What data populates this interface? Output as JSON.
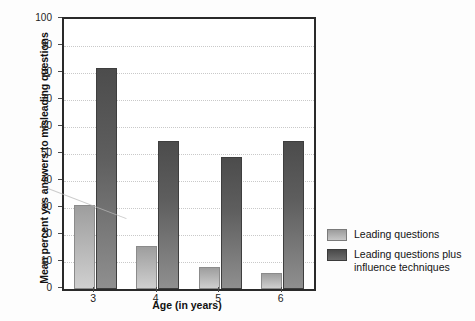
{
  "chart_data": {
    "type": "bar",
    "title": "",
    "xlabel": "Age (in years)",
    "ylabel": "Mean percent yes answers to misleading questions",
    "categories": [
      "3",
      "4",
      "5",
      "6"
    ],
    "ylim": [
      0,
      100
    ],
    "yticks": [
      0,
      10,
      20,
      30,
      40,
      50,
      60,
      70,
      80,
      90,
      100
    ],
    "ytick_labels": [
      "0",
      "10",
      "20",
      "30",
      "40",
      "50",
      "60",
      "70",
      "80",
      "90",
      "100"
    ],
    "grid": true,
    "legend_position": "right",
    "series": [
      {
        "name": "Leading questions",
        "color": "#b4b4b4",
        "values": [
          31,
          16,
          8,
          6
        ]
      },
      {
        "name": "Leading questions plus influence techniques",
        "color": "#5e5e5e",
        "values": [
          82,
          55,
          49,
          55
        ]
      }
    ]
  },
  "legend": {
    "items": [
      {
        "label": "Leading questions"
      },
      {
        "label": "Leading questions plus influence techniques"
      }
    ]
  }
}
